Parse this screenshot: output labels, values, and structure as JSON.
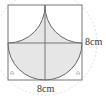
{
  "figure": {
    "labels": {
      "right_side": "8cm",
      "bottom_side": "8cm"
    },
    "colors": {
      "stroke": "#555555",
      "fill": "#e6e6e6",
      "dashed_circle": "#cccccc"
    }
  }
}
